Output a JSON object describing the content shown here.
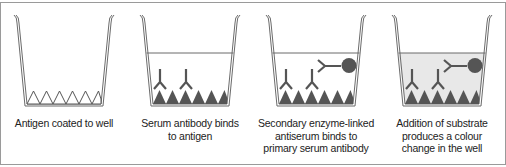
{
  "figure": {
    "type": "ELISA procedure diagram",
    "panels": [
      {
        "id": "step-1",
        "caption_lines": [
          "Antigen coated to well"
        ],
        "liquid": false,
        "antigen_style": "outline",
        "primary_antibodies": 0,
        "secondary_enzyme_antibody": false,
        "liquid_tinted": false
      },
      {
        "id": "step-2",
        "caption_lines": [
          "Serum antibody binds",
          "to antigen"
        ],
        "liquid": true,
        "antigen_style": "filled",
        "primary_antibodies": 2,
        "secondary_enzyme_antibody": false,
        "liquid_tinted": false
      },
      {
        "id": "step-3",
        "caption_lines": [
          "Secondary enzyme-linked",
          "antiserum binds to",
          "primary serum antibody"
        ],
        "liquid": true,
        "antigen_style": "filled",
        "primary_antibodies": 2,
        "secondary_enzyme_antibody": true,
        "liquid_tinted": false
      },
      {
        "id": "step-4",
        "caption_lines": [
          "Addition of substrate",
          "produces a colour",
          "change in the well"
        ],
        "liquid": true,
        "antigen_style": "filled",
        "primary_antibodies": 2,
        "secondary_enzyme_antibody": true,
        "liquid_tinted": true
      }
    ],
    "colors": {
      "well_outline": "#6b6b6b",
      "antigen_fill": "#555555",
      "antibody": "#555555",
      "liquid_line": "#6b6b6b",
      "liquid_tint": "#e8e8e8",
      "text": "#222222",
      "frame": "#9a9a9a"
    }
  }
}
